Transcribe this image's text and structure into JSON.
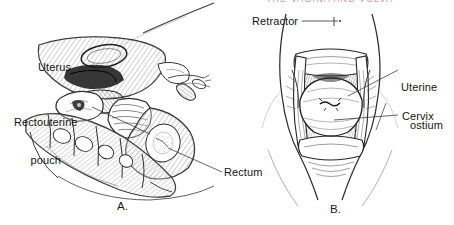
{
  "figure": {
    "background_color": "#ffffff",
    "ink_color": "#1a1a1a",
    "header_fragment": "THE VAGINA AND VULVA",
    "header_color": "#b4565a"
  },
  "panels": [
    {
      "letter": "A.",
      "name": "sagittal-pelvis-section",
      "labels": [
        {
          "text": "Uterus",
          "name": "label-uterus"
        },
        {
          "text": "Rectouterine",
          "text2": "pouch",
          "name": "label-rectouterine-pouch"
        },
        {
          "text": "Rectum",
          "name": "label-rectum"
        }
      ]
    },
    {
      "letter": "B.",
      "name": "speculum-cervix-view",
      "labels": [
        {
          "text": "Retractor",
          "name": "label-retractor"
        },
        {
          "text": "Uterine",
          "text2": "ostium",
          "name": "label-uterine-ostium"
        },
        {
          "text": "Cervix",
          "name": "label-cervix"
        }
      ]
    }
  ],
  "labels_flat": {
    "uterus": "Uterus",
    "rectouterine_line1": "Rectouterine",
    "rectouterine_line2": "pouch",
    "rectum": "Rectum",
    "retractor": "Retractor",
    "uterine_ostium_line1": "Uterine",
    "uterine_ostium_line2": "ostium",
    "cervix": "Cervix",
    "panel_a": "A.",
    "panel_b": "B."
  }
}
